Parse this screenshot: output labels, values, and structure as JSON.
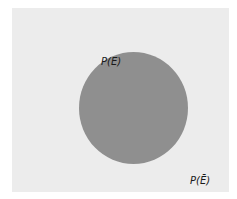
{
  "diagram": {
    "type": "venn",
    "sample_space": {
      "label": "P(Ē)",
      "fill": "#ececec"
    },
    "event": {
      "label": "P(E)",
      "fill": "#8f8f8f"
    }
  }
}
